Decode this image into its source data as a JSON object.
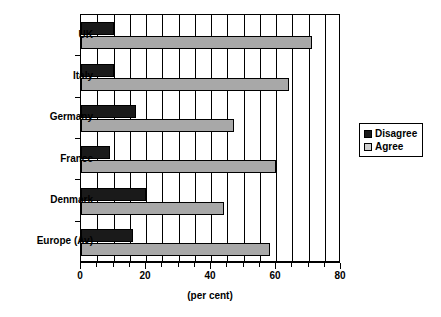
{
  "chart_data": {
    "type": "bar",
    "orientation": "horizontal",
    "title": "",
    "subtitle": "",
    "xlabel": "(per cent)",
    "ylabel": "",
    "xlim": [
      0,
      80
    ],
    "xticks": [
      0,
      20,
      40,
      60,
      80
    ],
    "xtick_labels": [
      "0",
      "20",
      "40",
      "60",
      "80"
    ],
    "minor_tick_step": 5,
    "grid": "vertical-minor",
    "legend_position": "right",
    "categories": [
      "UK",
      "Italy",
      "Germany",
      "France",
      "Denmark",
      "Europe (Av)"
    ],
    "series": [
      {
        "name": "Disagree",
        "color": "#1a1a1a",
        "values": [
          10,
          10,
          17,
          9,
          20,
          16
        ]
      },
      {
        "name": "Agree",
        "color": "#a8a8a8",
        "values": [
          71,
          64,
          47,
          60,
          44,
          58
        ]
      }
    ]
  },
  "legend": {
    "entries": [
      {
        "label": "Disagree",
        "swatch": "disagree"
      },
      {
        "label": "Agree",
        "swatch": "agree"
      }
    ]
  },
  "axis": {
    "x_title": "(per cent)"
  }
}
